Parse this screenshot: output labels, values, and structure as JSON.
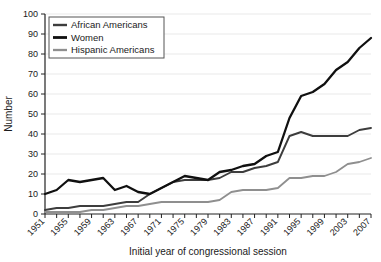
{
  "chart_data": {
    "type": "line",
    "title": "",
    "xlabel": "Initial year of congressional session",
    "ylabel": "Number",
    "xlim": [
      1951,
      2007
    ],
    "ylim": [
      0,
      100
    ],
    "grid": true,
    "legend_position": "top-left",
    "x": [
      1951,
      1953,
      1955,
      1957,
      1959,
      1961,
      1963,
      1965,
      1967,
      1969,
      1971,
      1973,
      1975,
      1977,
      1979,
      1981,
      1983,
      1985,
      1987,
      1989,
      1991,
      1993,
      1995,
      1997,
      1999,
      2001,
      2003,
      2005,
      2007
    ],
    "xticks": [
      1951,
      1955,
      1959,
      1963,
      1967,
      1971,
      1975,
      1979,
      1983,
      1987,
      1991,
      1995,
      1999,
      2003,
      2007
    ],
    "xtick_labels": [
      "1951",
      "1955",
      "1959",
      "1963",
      "1967",
      "1971",
      "1975",
      "1979",
      "1983",
      "1987",
      "1991",
      "1995",
      "1999",
      "2003",
      "2007"
    ],
    "yticks": [
      0,
      10,
      20,
      30,
      40,
      50,
      60,
      70,
      80,
      90,
      100
    ],
    "ytick_labels": [
      "0",
      "10",
      "20",
      "30",
      "40",
      "50",
      "60",
      "70",
      "80",
      "90",
      "100"
    ],
    "series": [
      {
        "name": "African Americans",
        "color": "#3d3d3d",
        "width": 1.9,
        "values": [
          2,
          3,
          3,
          4,
          4,
          4,
          5,
          6,
          6,
          10,
          13,
          16,
          17,
          17,
          17,
          18,
          21,
          21,
          23,
          24,
          26,
          39,
          41,
          39,
          39,
          39,
          39,
          42,
          43
        ]
      },
      {
        "name": "Women",
        "color": "#101010",
        "width": 2.3,
        "values": [
          10,
          12,
          17,
          16,
          17,
          18,
          12,
          14,
          11,
          10,
          13,
          16,
          19,
          18,
          17,
          21,
          22,
          24,
          25,
          29,
          31,
          48,
          59,
          61,
          65,
          72,
          76,
          83,
          88
        ]
      },
      {
        "name": "Hispanic Americans",
        "color": "#8f8f8f",
        "width": 1.8,
        "values": [
          1,
          1,
          1,
          1,
          2,
          2,
          3,
          4,
          4,
          5,
          6,
          6,
          6,
          6,
          6,
          7,
          11,
          12,
          12,
          12,
          13,
          18,
          18,
          19,
          19,
          21,
          25,
          26,
          28
        ]
      }
    ]
  },
  "legend": {
    "items": [
      {
        "label": "African Americans"
      },
      {
        "label": "Women"
      },
      {
        "label": "Hispanic Americans"
      }
    ]
  }
}
